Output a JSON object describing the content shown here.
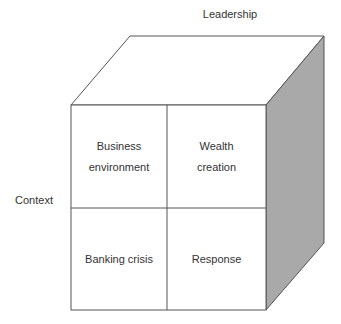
{
  "title_top": "Leadership",
  "label_left": "Context",
  "cells": {
    "top_left": [
      "Business",
      "environment"
    ],
    "top_right": [
      "Wealth",
      "creation"
    ],
    "bottom_left": [
      "Banking crisis"
    ],
    "bottom_right": [
      "Response"
    ]
  },
  "colors": {
    "side_face": "#a9a9a9",
    "front_face": "#ffffff",
    "top_face": "#ffffff",
    "stroke": "#444444"
  }
}
